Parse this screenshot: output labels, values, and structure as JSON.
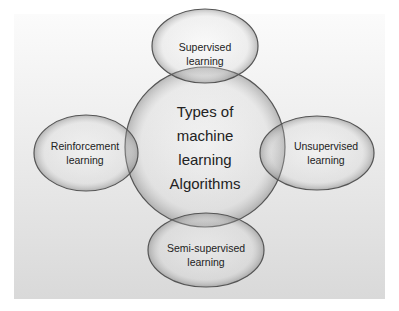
{
  "diagram": {
    "center": {
      "lines": [
        "Types of",
        "machine",
        "learning",
        "Algorithms"
      ]
    },
    "nodes": {
      "top": {
        "lines": [
          "Supervised",
          "learning"
        ]
      },
      "left": {
        "lines": [
          "Reinforcement",
          "learning"
        ]
      },
      "right": {
        "lines": [
          "Unsupervised",
          "learning"
        ]
      },
      "bottom": {
        "lines": [
          "Semi-supervised",
          "learning"
        ]
      }
    },
    "colors": {
      "background_top": "#fbfbfb",
      "background_bottom": "#d9d9d9",
      "shape_stroke": "#555555",
      "text": "#222222"
    }
  }
}
